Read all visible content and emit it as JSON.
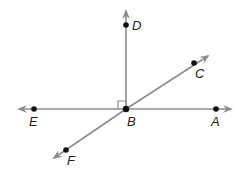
{
  "diagram": {
    "type": "geometry-lines",
    "colors": {
      "line": "#8c8c8c",
      "point": "#111111",
      "label": "#222222"
    },
    "points": [
      {
        "name": "D",
        "label": "D"
      },
      {
        "name": "C",
        "label": "C"
      },
      {
        "name": "E",
        "label": "E"
      },
      {
        "name": "B",
        "label": "B"
      },
      {
        "name": "A",
        "label": "A"
      },
      {
        "name": "F",
        "label": "F"
      }
    ],
    "lines": [
      "EA",
      "FC"
    ],
    "rays": [
      "BD"
    ],
    "right_angle": "DBE"
  }
}
